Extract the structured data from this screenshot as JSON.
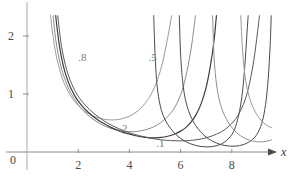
{
  "chart_data": {
    "type": "line",
    "title": "",
    "subtitle": "",
    "xlabel": "x",
    "ylabel": "",
    "xlim": [
      -0.2,
      9.6
    ],
    "ylim": [
      -0.12,
      2.35
    ],
    "grid": false,
    "legend": "inline-curve-labels",
    "x_ticks": [
      2,
      4,
      6,
      8
    ],
    "x_tick_labels": [
      "2",
      "4",
      "6",
      "8"
    ],
    "y_ticks": [
      1,
      2
    ],
    "y_tick_labels": [
      "1",
      "2"
    ],
    "origin_label": "0",
    "axis_arrow": "x-axis-right-arrow",
    "series": [
      {
        "name": ".8",
        "label": ".8",
        "label_x": 2.0,
        "label_y": 1.62,
        "color": "#9a9a9a",
        "width": 1.0,
        "points": [
          [
            0.92,
            2.35
          ],
          [
            1.0,
            2.05
          ],
          [
            1.1,
            1.76
          ],
          [
            1.2,
            1.55
          ],
          [
            1.35,
            1.31
          ],
          [
            1.5,
            1.14
          ],
          [
            1.7,
            0.97
          ],
          [
            1.9,
            0.85
          ],
          [
            2.1,
            0.76
          ],
          [
            2.3,
            0.69
          ],
          [
            2.5,
            0.64
          ],
          [
            2.7,
            0.6
          ],
          [
            2.9,
            0.575
          ],
          [
            3.1,
            0.558
          ],
          [
            3.3,
            0.552
          ],
          [
            3.5,
            0.556
          ],
          [
            3.7,
            0.572
          ],
          [
            3.9,
            0.6
          ],
          [
            4.1,
            0.64
          ],
          [
            4.3,
            0.7
          ],
          [
            4.5,
            0.78
          ],
          [
            4.7,
            0.89
          ],
          [
            4.9,
            1.04
          ],
          [
            5.1,
            1.25
          ],
          [
            5.3,
            1.55
          ],
          [
            5.5,
            1.98
          ],
          [
            5.65,
            2.35
          ]
        ]
      },
      {
        "name": ".5",
        "label": ".5",
        "label_x": 4.75,
        "label_y": 1.62,
        "color": "#8c8c8c",
        "width": 1.0,
        "points": [
          [
            1.02,
            2.35
          ],
          [
            1.12,
            1.95
          ],
          [
            1.25,
            1.62
          ],
          [
            1.4,
            1.36
          ],
          [
            1.6,
            1.12
          ],
          [
            1.8,
            0.95
          ],
          [
            2.0,
            0.82
          ],
          [
            2.2,
            0.71
          ],
          [
            2.45,
            0.61
          ],
          [
            2.7,
            0.53
          ],
          [
            2.95,
            0.465
          ],
          [
            3.2,
            0.42
          ],
          [
            3.45,
            0.385
          ],
          [
            3.7,
            0.363
          ],
          [
            3.95,
            0.352
          ],
          [
            4.2,
            0.352
          ],
          [
            4.45,
            0.365
          ],
          [
            4.7,
            0.392
          ],
          [
            4.95,
            0.435
          ],
          [
            5.2,
            0.5
          ],
          [
            5.45,
            0.59
          ],
          [
            5.7,
            0.72
          ],
          [
            5.9,
            0.88
          ],
          [
            6.1,
            1.12
          ],
          [
            6.3,
            1.5
          ],
          [
            6.45,
            1.9
          ],
          [
            6.58,
            2.35
          ]
        ]
      },
      {
        "name": ".2",
        "label": ".2",
        "label_x": 3.6,
        "label_y": 0.4,
        "color": "#3d3d3d",
        "width": 1.2,
        "points": [
          [
            1.12,
            2.35
          ],
          [
            1.25,
            1.88
          ],
          [
            1.4,
            1.52
          ],
          [
            1.6,
            1.22
          ],
          [
            1.85,
            0.98
          ],
          [
            2.1,
            0.82
          ],
          [
            2.4,
            0.68
          ],
          [
            2.7,
            0.575
          ],
          [
            3.0,
            0.49
          ],
          [
            3.3,
            0.42
          ],
          [
            3.6,
            0.365
          ],
          [
            3.9,
            0.32
          ],
          [
            4.2,
            0.285
          ],
          [
            4.5,
            0.26
          ],
          [
            4.75,
            0.248
          ],
          [
            5.0,
            0.245
          ],
          [
            5.25,
            0.252
          ],
          [
            5.5,
            0.272
          ],
          [
            5.75,
            0.305
          ],
          [
            6.0,
            0.36
          ],
          [
            6.2,
            0.42
          ],
          [
            6.4,
            0.51
          ],
          [
            6.6,
            0.64
          ],
          [
            6.8,
            0.83
          ],
          [
            7.0,
            1.12
          ],
          [
            7.15,
            1.45
          ],
          [
            7.3,
            1.9
          ],
          [
            7.4,
            2.35
          ]
        ]
      },
      {
        "name": ".1",
        "label": ".1",
        "label_x": 5.05,
        "label_y": 0.135,
        "color": "#5a5a5a",
        "width": 1.0,
        "points": [
          [
            1.2,
            2.35
          ],
          [
            1.35,
            1.82
          ],
          [
            1.55,
            1.42
          ],
          [
            1.8,
            1.12
          ],
          [
            2.1,
            0.9
          ],
          [
            2.45,
            0.73
          ],
          [
            2.8,
            0.6
          ],
          [
            3.2,
            0.485
          ],
          [
            3.6,
            0.4
          ],
          [
            4.0,
            0.332
          ],
          [
            4.4,
            0.28
          ],
          [
            4.8,
            0.24
          ],
          [
            5.2,
            0.212
          ],
          [
            5.6,
            0.196
          ],
          [
            6.0,
            0.192
          ],
          [
            6.4,
            0.2
          ],
          [
            6.8,
            0.225
          ],
          [
            7.2,
            0.272
          ],
          [
            7.6,
            0.35
          ],
          [
            7.9,
            0.45
          ],
          [
            8.2,
            0.6
          ],
          [
            8.45,
            0.82
          ],
          [
            8.65,
            1.1
          ],
          [
            8.85,
            1.55
          ],
          [
            9.0,
            2.05
          ],
          [
            9.08,
            2.35
          ]
        ]
      },
      {
        "name": "resonance-spike-a",
        "label": "",
        "label_x": null,
        "label_y": null,
        "color": "#4a4a4a",
        "width": 1.0,
        "points": [
          [
            4.95,
            2.35
          ],
          [
            5.0,
            1.7
          ],
          [
            5.06,
            1.25
          ],
          [
            5.14,
            0.95
          ],
          [
            5.25,
            0.72
          ],
          [
            5.4,
            0.55
          ],
          [
            5.6,
            0.41
          ],
          [
            5.8,
            0.31
          ],
          [
            6.0,
            0.235
          ],
          [
            6.2,
            0.18
          ],
          [
            6.4,
            0.14
          ],
          [
            6.6,
            0.112
          ],
          [
            6.8,
            0.095
          ],
          [
            7.0,
            0.088
          ],
          [
            7.2,
            0.092
          ],
          [
            7.4,
            0.108
          ],
          [
            7.6,
            0.14
          ],
          [
            7.8,
            0.2
          ],
          [
            8.0,
            0.3
          ],
          [
            8.15,
            0.44
          ],
          [
            8.3,
            0.7
          ],
          [
            8.42,
            1.05
          ],
          [
            8.52,
            1.55
          ],
          [
            8.6,
            2.1
          ],
          [
            8.64,
            2.35
          ]
        ]
      },
      {
        "name": "resonance-spike-b",
        "label": "",
        "label_x": null,
        "label_y": null,
        "color": "#4a4a4a",
        "width": 1.0,
        "points": [
          [
            5.95,
            2.35
          ],
          [
            6.0,
            1.68
          ],
          [
            6.08,
            1.22
          ],
          [
            6.18,
            0.92
          ],
          [
            6.32,
            0.7
          ],
          [
            6.5,
            0.52
          ],
          [
            6.7,
            0.39
          ],
          [
            6.9,
            0.295
          ],
          [
            7.1,
            0.225
          ],
          [
            7.3,
            0.175
          ],
          [
            7.5,
            0.138
          ],
          [
            7.7,
            0.115
          ],
          [
            7.9,
            0.102
          ],
          [
            8.1,
            0.1
          ],
          [
            8.3,
            0.11
          ],
          [
            8.5,
            0.135
          ],
          [
            8.7,
            0.18
          ],
          [
            8.9,
            0.255
          ],
          [
            9.05,
            0.36
          ],
          [
            9.2,
            0.54
          ],
          [
            9.32,
            0.82
          ],
          [
            9.42,
            1.25
          ],
          [
            9.5,
            1.85
          ],
          [
            9.54,
            2.35
          ]
        ]
      },
      {
        "name": "resonance-spike-c",
        "label": "",
        "label_x": null,
        "label_y": null,
        "color": "#8f8f8f",
        "width": 1.0,
        "points": [
          [
            7.25,
            2.35
          ],
          [
            7.3,
            1.7
          ],
          [
            7.38,
            1.25
          ],
          [
            7.5,
            0.92
          ],
          [
            7.65,
            0.7
          ],
          [
            7.85,
            0.52
          ],
          [
            8.05,
            0.4
          ],
          [
            8.25,
            0.31
          ],
          [
            8.45,
            0.25
          ],
          [
            8.65,
            0.21
          ],
          [
            8.85,
            0.185
          ],
          [
            9.05,
            0.175
          ],
          [
            9.25,
            0.178
          ],
          [
            9.45,
            0.195
          ],
          [
            9.55,
            0.21
          ]
        ]
      },
      {
        "name": "resonance-spike-d",
        "label": "",
        "label_x": null,
        "label_y": null,
        "color": "#9a9a9a",
        "width": 1.0,
        "points": [
          [
            8.35,
            2.35
          ],
          [
            8.42,
            1.75
          ],
          [
            8.52,
            1.3
          ],
          [
            8.65,
            1.0
          ],
          [
            8.82,
            0.78
          ],
          [
            9.0,
            0.63
          ],
          [
            9.2,
            0.52
          ],
          [
            9.4,
            0.45
          ],
          [
            9.55,
            0.42
          ]
        ]
      }
    ],
    "annotations": [
      {
        "text": ".8",
        "x": 2.0,
        "y": 1.62
      },
      {
        "text": ".5",
        "x": 4.75,
        "y": 1.62
      },
      {
        "text": ".2",
        "x": 3.6,
        "y": 0.4
      },
      {
        "text": ".1",
        "x": 5.05,
        "y": 0.135
      }
    ]
  },
  "axes": {
    "x_axis_name": "x",
    "origin": "0",
    "x_tick_labels": [
      "2",
      "4",
      "6",
      "8"
    ],
    "y_tick_labels": [
      "1",
      "2"
    ],
    "axis_color": "#8a8a8a",
    "text_color": "#4a4a4a"
  }
}
